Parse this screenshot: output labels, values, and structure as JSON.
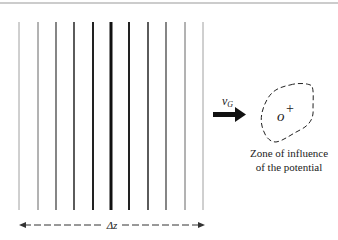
{
  "diagram": {
    "lines": {
      "count": 11,
      "x_positions": [
        19,
        38,
        56,
        74,
        93,
        111,
        129,
        148,
        166,
        185,
        203
      ],
      "widths": [
        0.8,
        1.0,
        1.3,
        1.6,
        2.0,
        3.0,
        2.0,
        1.6,
        1.3,
        1.0,
        0.8
      ],
      "colors": [
        "#888888",
        "#666666",
        "#444444",
        "#333333",
        "#222222",
        "#111111",
        "#222222",
        "#333333",
        "#444444",
        "#666666",
        "#888888"
      ]
    },
    "velocity_label": "v",
    "velocity_subscript": "G",
    "origin_label": "o",
    "origin_mark": "+",
    "zone_caption_line1": "Zone of influence",
    "zone_caption_line2": "of the potential",
    "span_label": "Δz"
  }
}
